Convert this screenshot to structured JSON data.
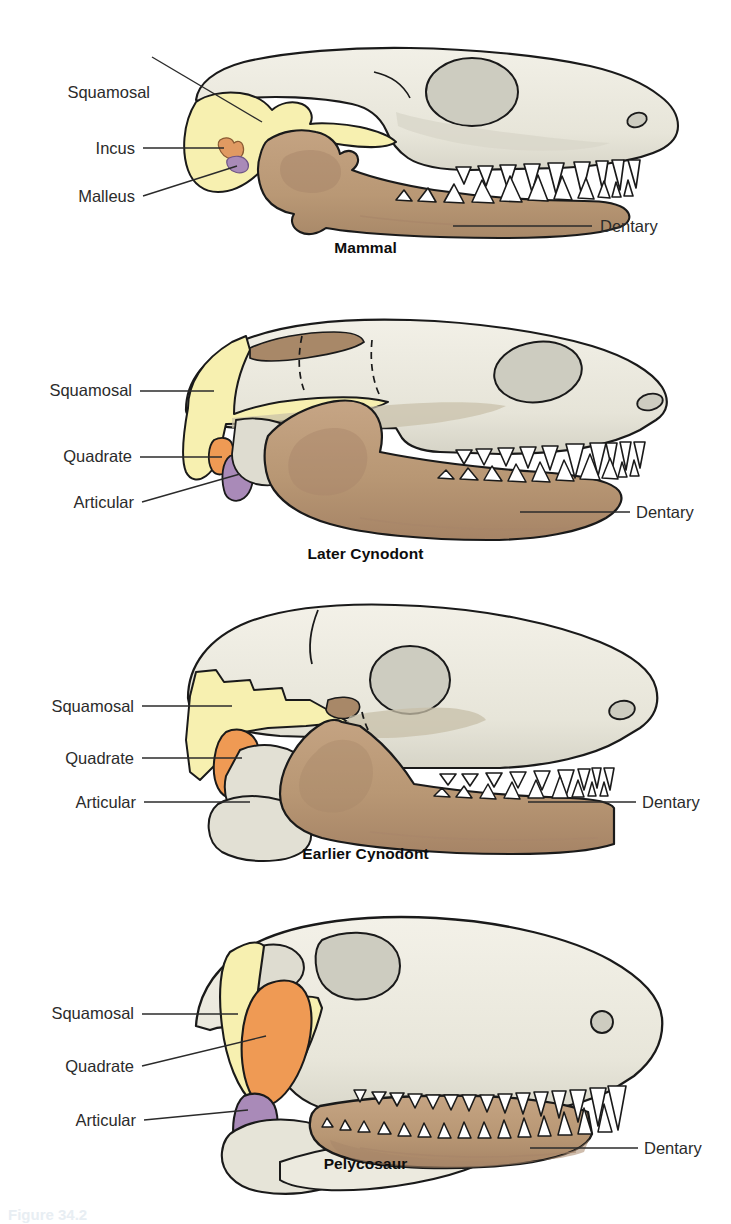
{
  "figure": {
    "background": "#ffffff",
    "partial_caption": "Figure 34.2"
  },
  "colors": {
    "bone": "#e9e7dc",
    "bone_shadow": "#cdccc0",
    "squamosal": "#f7f0b0",
    "quadrate": "#ef9a54",
    "articular": "#a98ab8",
    "dentary": "#b99875",
    "dentary_shadow": "#a8866a",
    "incus": "#e09a62",
    "malleus": "#a98ab8",
    "outline": "#1a1a1a",
    "leader_line": "#2b2b2b",
    "text": "#2b2b2b",
    "caption_text": "#0d0d0d",
    "tooth": "#ffffff"
  },
  "panels": [
    {
      "id": "mammal",
      "caption": "Mammal",
      "labels": [
        {
          "name": "squamosal",
          "text": "Squamosal",
          "side": "left"
        },
        {
          "name": "incus",
          "text": "Incus",
          "side": "left"
        },
        {
          "name": "malleus",
          "text": "Malleus",
          "side": "left"
        },
        {
          "name": "dentary",
          "text": "Dentary",
          "side": "right"
        }
      ]
    },
    {
      "id": "later-cynodont",
      "caption": "Later Cynodont",
      "labels": [
        {
          "name": "squamosal",
          "text": "Squamosal",
          "side": "left"
        },
        {
          "name": "quadrate",
          "text": "Quadrate",
          "side": "left"
        },
        {
          "name": "articular",
          "text": "Articular",
          "side": "left"
        },
        {
          "name": "dentary",
          "text": "Dentary",
          "side": "right"
        }
      ]
    },
    {
      "id": "earlier-cynodont",
      "caption": "Earlier Cynodont",
      "labels": [
        {
          "name": "squamosal",
          "text": "Squamosal",
          "side": "left"
        },
        {
          "name": "quadrate",
          "text": "Quadrate",
          "side": "left"
        },
        {
          "name": "articular",
          "text": "Articular",
          "side": "left"
        },
        {
          "name": "dentary",
          "text": "Dentary",
          "side": "right"
        }
      ]
    },
    {
      "id": "pelycosaur",
      "caption": "Pelycosaur",
      "labels": [
        {
          "name": "squamosal",
          "text": "Squamosal",
          "side": "left"
        },
        {
          "name": "quadrate",
          "text": "Quadrate",
          "side": "left"
        },
        {
          "name": "articular",
          "text": "Articular",
          "side": "left"
        },
        {
          "name": "dentary",
          "text": "Dentary",
          "side": "right"
        }
      ]
    }
  ]
}
